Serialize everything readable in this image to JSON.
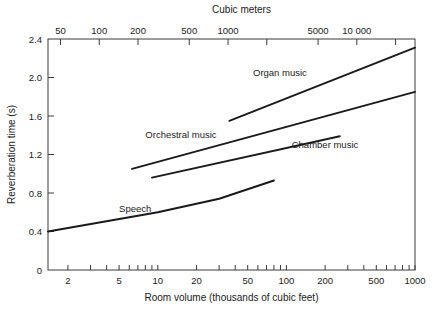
{
  "chart_data": {
    "type": "line",
    "title": "",
    "xlabel": "Room volume (thousands of cubic feet)",
    "ylabel": "Reverberation time (s)",
    "top_axis_label": "Cubic meters",
    "xscale": "log",
    "yscale": "linear",
    "xlim": [
      1.4,
      1000
    ],
    "ylim": [
      0,
      2.4
    ],
    "grid": false,
    "legend": "inline-annotations",
    "x_ticks": [
      {
        "value": 2,
        "label": "2"
      },
      {
        "value": 5,
        "label": "5"
      },
      {
        "value": 10,
        "label": "10"
      },
      {
        "value": 20,
        "label": "20"
      },
      {
        "value": 50,
        "label": "50"
      },
      {
        "value": 100,
        "label": "100"
      },
      {
        "value": 200,
        "label": "200"
      },
      {
        "value": 500,
        "label": "500"
      },
      {
        "value": 1000,
        "label": "1000"
      }
    ],
    "y_ticks": [
      {
        "value": 0,
        "label": "0"
      },
      {
        "value": 0.4,
        "label": "0.4"
      },
      {
        "value": 0.8,
        "label": "0.8"
      },
      {
        "value": 1.2,
        "label": "1.2"
      },
      {
        "value": 1.6,
        "label": "1.6"
      },
      {
        "value": 2.0,
        "label": "2.0"
      },
      {
        "value": 2.4,
        "label": "2.4"
      }
    ],
    "top_ticks": [
      {
        "value": 50,
        "label": "50"
      },
      {
        "value": 100,
        "label": "100"
      },
      {
        "value": 200,
        "label": "200"
      },
      {
        "value": 500,
        "label": "500"
      },
      {
        "value": 1000,
        "label": "1000"
      },
      {
        "value": 2000,
        "label": ""
      },
      {
        "value": 5000,
        "label": "5000"
      },
      {
        "value": 10000,
        "label": "10 000"
      },
      {
        "value": 20000,
        "label": ""
      }
    ],
    "series": [
      {
        "name": "Speech",
        "label": "Speech",
        "label_x": 5.0,
        "label_y": 0.6,
        "points": [
          {
            "x": 1.4,
            "y": 0.4
          },
          {
            "x": 10,
            "y": 0.6
          },
          {
            "x": 30,
            "y": 0.74
          },
          {
            "x": 80,
            "y": 0.93
          }
        ]
      },
      {
        "name": "Chamber music",
        "label": "Chamber music",
        "label_x": 110,
        "label_y": 1.27,
        "points": [
          {
            "x": 9.0,
            "y": 0.96
          },
          {
            "x": 260,
            "y": 1.39
          }
        ]
      },
      {
        "name": "Orchestral music",
        "label": "Orchestral music",
        "label_x": 8.0,
        "label_y": 1.37,
        "points": [
          {
            "x": 6.3,
            "y": 1.05
          },
          {
            "x": 1000,
            "y": 1.85
          }
        ]
      },
      {
        "name": "Organ music",
        "label": "Organ music",
        "label_x": 55,
        "label_y": 2.02,
        "points": [
          {
            "x": 36,
            "y": 1.55
          },
          {
            "x": 1000,
            "y": 2.31
          }
        ]
      }
    ]
  },
  "geometry": {
    "plot_left": 48,
    "plot_right": 415,
    "plot_top": 39,
    "plot_bottom": 270,
    "cubic_meters_at_left": 40,
    "cubic_meters_at_right": 28300
  },
  "colors": {
    "axis": "#3a3a3a",
    "curve": "#1a1a1a",
    "background": "#ffffff",
    "text": "#1a1a1a"
  }
}
